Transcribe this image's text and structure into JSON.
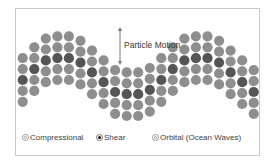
{
  "diagram": {
    "type": "wave-particle-diagram",
    "annotation": {
      "label": "Particle Motion",
      "arrow": "double-headed-vertical"
    },
    "colors": {
      "particle": "#8e8e8e",
      "highlight_particle": "#555555",
      "frame": "#c8c8c8",
      "text": "#404040"
    },
    "columns": [
      {
        "rows": 5,
        "offset": 3.0,
        "highlight": 2
      },
      {
        "rows": 5,
        "offset": 2.0,
        "highlight": 2
      },
      {
        "rows": 5,
        "offset": 1.2,
        "highlight": 2
      },
      {
        "rows": 5,
        "offset": 1.0,
        "highlight": 2
      },
      {
        "rows": 5,
        "offset": 1.0,
        "highlight": 2
      },
      {
        "rows": 5,
        "offset": 1.4,
        "highlight": 2
      },
      {
        "rows": 5,
        "offset": 2.3,
        "highlight": 2
      },
      {
        "rows": 5,
        "offset": 3.2,
        "highlight": 2
      },
      {
        "rows": 5,
        "offset": 4.1,
        "highlight": 2
      },
      {
        "rows": 5,
        "offset": 4.3,
        "highlight": 2
      },
      {
        "rows": 5,
        "offset": 4.3,
        "highlight": 2
      },
      {
        "rows": 5,
        "offset": 3.9,
        "highlight": 2
      },
      {
        "rows": 5,
        "offset": 3.0,
        "highlight": 2
      },
      {
        "rows": 5,
        "offset": 2.0,
        "highlight": 2
      },
      {
        "rows": 5,
        "offset": 1.2,
        "highlight": 2
      },
      {
        "rows": 5,
        "offset": 1.0,
        "highlight": 2
      },
      {
        "rows": 5,
        "offset": 1.0,
        "highlight": 2
      },
      {
        "rows": 5,
        "offset": 1.4,
        "highlight": 2
      },
      {
        "rows": 5,
        "offset": 2.3,
        "highlight": 2
      },
      {
        "rows": 5,
        "offset": 3.2,
        "highlight": 2
      },
      {
        "rows": 5,
        "offset": 4.1,
        "highlight": 2
      }
    ]
  },
  "legend": {
    "items": [
      {
        "label": "Compressional",
        "marker": "ring",
        "selected": false
      },
      {
        "label": "Shear",
        "marker": "solid",
        "selected": true
      },
      {
        "label": "Orbital (Ocean Waves)",
        "marker": "ring",
        "selected": false
      }
    ]
  }
}
